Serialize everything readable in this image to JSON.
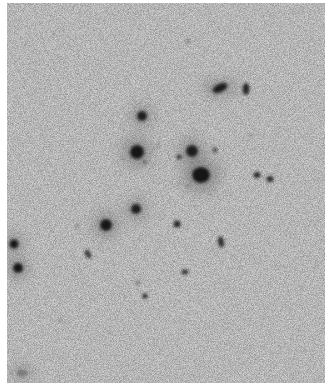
{
  "image": {
    "description": "Grayscale negative astronomical plate of a galaxy cluster",
    "background_color": "#cfcfcf",
    "object_color": "#141414",
    "plate": {
      "x": 7,
      "y": 3,
      "width": 318,
      "height": 380
    },
    "objects": [
      {
        "x": 220,
        "y": 88,
        "rx": 8,
        "ry": 4,
        "rot": -25,
        "o": 0.95
      },
      {
        "x": 246,
        "y": 89,
        "rx": 3.5,
        "ry": 6,
        "rot": 0,
        "o": 0.9
      },
      {
        "x": 142,
        "y": 116,
        "rx": 5,
        "ry": 5,
        "rot": 0,
        "o": 0.95
      },
      {
        "x": 137,
        "y": 152,
        "rx": 7,
        "ry": 7,
        "rot": 0,
        "o": 1
      },
      {
        "x": 192,
        "y": 151,
        "rx": 6,
        "ry": 6,
        "rot": 0,
        "o": 0.95
      },
      {
        "x": 201,
        "y": 175,
        "rx": 9,
        "ry": 8,
        "rot": 0,
        "o": 1
      },
      {
        "x": 179,
        "y": 157,
        "rx": 2.5,
        "ry": 2.5,
        "rot": 0,
        "o": 0.8
      },
      {
        "x": 215,
        "y": 150,
        "rx": 2.5,
        "ry": 3,
        "rot": 0,
        "o": 0.6
      },
      {
        "x": 257,
        "y": 175,
        "rx": 3.5,
        "ry": 3,
        "rot": 0,
        "o": 0.9
      },
      {
        "x": 270,
        "y": 179,
        "rx": 3.5,
        "ry": 3,
        "rot": 0,
        "o": 0.9
      },
      {
        "x": 136,
        "y": 209,
        "rx": 5,
        "ry": 5,
        "rot": 0,
        "o": 0.95
      },
      {
        "x": 106,
        "y": 225,
        "rx": 6,
        "ry": 6,
        "rot": 0,
        "o": 1
      },
      {
        "x": 177,
        "y": 224,
        "rx": 3.5,
        "ry": 3.5,
        "rot": 0,
        "o": 0.9
      },
      {
        "x": 221,
        "y": 242,
        "rx": 3,
        "ry": 5.5,
        "rot": -10,
        "o": 0.85
      },
      {
        "x": 14,
        "y": 244,
        "rx": 4.5,
        "ry": 4.5,
        "rot": 0,
        "o": 1
      },
      {
        "x": 18,
        "y": 268,
        "rx": 5,
        "ry": 5,
        "rot": 0,
        "o": 1
      },
      {
        "x": 88,
        "y": 254,
        "rx": 2.5,
        "ry": 4.5,
        "rot": -25,
        "o": 0.85
      },
      {
        "x": 185,
        "y": 272,
        "rx": 3.5,
        "ry": 2.5,
        "rot": 0,
        "o": 0.8
      },
      {
        "x": 138,
        "y": 283,
        "rx": 1.5,
        "ry": 2,
        "rot": 0,
        "o": 0.6
      },
      {
        "x": 145,
        "y": 296,
        "rx": 2.5,
        "ry": 2.5,
        "rot": 0,
        "o": 0.95
      },
      {
        "x": 77,
        "y": 226,
        "rx": 2,
        "ry": 2,
        "rot": 0,
        "o": 0.35
      },
      {
        "x": 60,
        "y": 320,
        "rx": 1.5,
        "ry": 1.5,
        "rot": 0,
        "o": 0.4
      },
      {
        "x": 22,
        "y": 373,
        "rx": 5,
        "ry": 3,
        "rot": 0,
        "o": 0.3
      },
      {
        "x": 145,
        "y": 162,
        "rx": 1.5,
        "ry": 1.5,
        "rot": 0,
        "o": 0.7
      },
      {
        "x": 158,
        "y": 146,
        "rx": 1,
        "ry": 1,
        "rot": 0,
        "o": 0.8
      },
      {
        "x": 250,
        "y": 135,
        "rx": 1,
        "ry": 1,
        "rot": 0,
        "o": 0.7
      },
      {
        "x": 188,
        "y": 41,
        "rx": 3,
        "ry": 1.5,
        "rot": 0,
        "o": 0.3
      },
      {
        "x": 188,
        "y": 186,
        "rx": 1,
        "ry": 1,
        "rot": 0,
        "o": 0.6
      }
    ]
  }
}
